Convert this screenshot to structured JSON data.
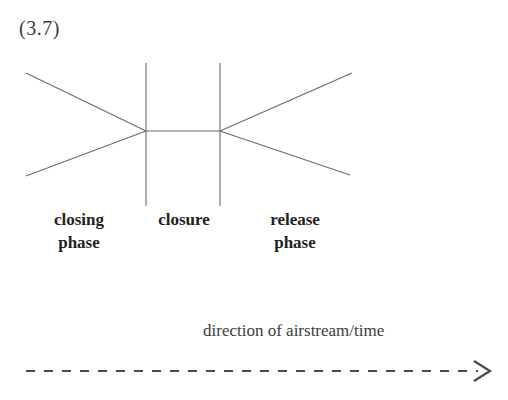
{
  "example": {
    "number_label": "(3.7)"
  },
  "diagram": {
    "title_note": "vocal-tract stricture diagram",
    "line_color": "#6a6a6a",
    "labels": {
      "closing_phase": "closing\nphase",
      "closure": "closure",
      "release_phase": "release\nphase"
    }
  },
  "airstream": {
    "caption": "direction of airstream/time",
    "arrow_color": "#4a4a4a"
  },
  "icons": {
    "arrow_right": "arrow-right-icon"
  }
}
